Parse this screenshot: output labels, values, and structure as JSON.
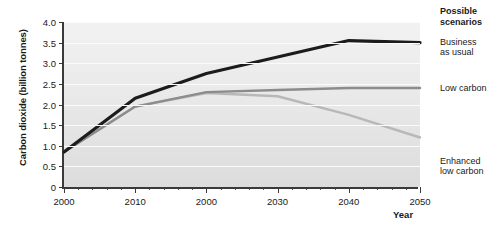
{
  "chart_data": {
    "type": "line",
    "title": "",
    "xlabel": "Year",
    "ylabel": "Carbon dioxide (billion tonnes)",
    "xlim": [
      2000,
      2050
    ],
    "ylim": [
      0,
      4.0
    ],
    "y_ticks": [
      "0",
      "0.5",
      "1.0",
      "1.5",
      "2.0",
      "2.5",
      "3.0",
      "3.5",
      "4.0"
    ],
    "y_tick_values": [
      0,
      0.5,
      1.0,
      1.5,
      2.0,
      2.5,
      3.0,
      3.5,
      4.0
    ],
    "x_ticks": [
      "2000",
      "2010",
      "2000",
      "2030",
      "2040",
      "2050"
    ],
    "x_tick_values": [
      2000,
      2010,
      2020,
      2030,
      2040,
      2050
    ],
    "x_minor_step": 2,
    "grid": "horizontal",
    "legend_position": "right",
    "legend_title": "Possible scenarios",
    "x": [
      2000,
      2010,
      2020,
      2030,
      2040,
      2050
    ],
    "series": [
      {
        "name": "Business as usual",
        "color": "#1c1c1c",
        "values": [
          0.85,
          2.15,
          2.75,
          3.15,
          3.55,
          3.5
        ]
      },
      {
        "name": "Low carbon",
        "color": "#8c8c8c",
        "values": [
          0.85,
          1.95,
          2.3,
          2.35,
          2.4,
          2.4
        ]
      },
      {
        "name": "Enhanced low carbon",
        "color": "#b8b8b8",
        "values": [
          0.85,
          1.95,
          2.28,
          2.2,
          1.75,
          1.2
        ]
      }
    ]
  },
  "legend": {
    "title": "Possible scenarios",
    "entries": [
      {
        "label": "Business\nas usual"
      },
      {
        "label": "Low carbon"
      },
      {
        "label": "Enhanced\nlow carbon"
      }
    ]
  },
  "axes": {
    "y_title": "Carbon dioxide (billion tonnes)",
    "x_title": "Year"
  }
}
